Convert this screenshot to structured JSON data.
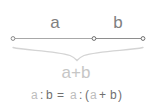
{
  "figure": {
    "background_color": "#ffffff",
    "line_color": "#9a9a9a",
    "brace_color": "#d0d0d0",
    "label_color": "#808080",
    "sum_color": "#c6c6c6",
    "formula_dark_color": "#707070",
    "formula_light_color": "#bdbdbd"
  },
  "labels": {
    "segment_a": "a",
    "segment_b": "b",
    "sum": "a+b"
  },
  "formula": {
    "full": "a : b = a : (a + b)",
    "parts": {
      "p1": "a",
      "p2": ":",
      "p3": "b",
      "p4": "=",
      "p5": "a",
      "p6": ":",
      "p7": "(",
      "p8": "a",
      "p9": "+",
      "p10": "b",
      "p11": ")"
    }
  },
  "points": {
    "left_endpoint": "left-endpoint-node",
    "middle_point": "middle-division-node",
    "right_endpoint": "right-endpoint-node"
  }
}
